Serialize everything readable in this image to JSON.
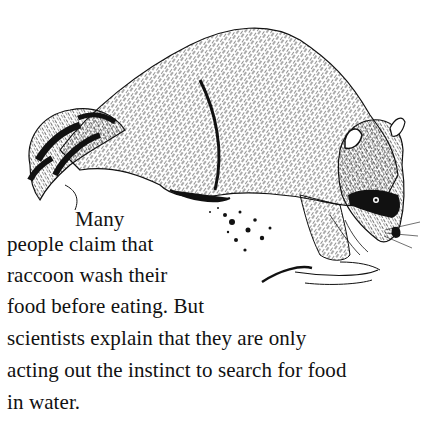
{
  "illustration": {
    "subject": "raccoon",
    "description": "Black-and-white pen-and-ink drawing of a raccoon crouching at the water's edge, ringed tail on the left, masked face on the right dipping its paw into water ripples"
  },
  "passage": {
    "lines": [
      "Many",
      "people claim that",
      "raccoon wash their",
      "food before eating. But",
      "scientists explain that they are only",
      "acting out the instinct to search for food",
      "in water."
    ]
  }
}
